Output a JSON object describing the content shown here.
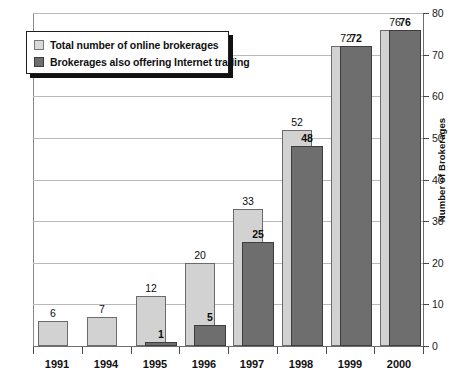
{
  "chart_data": {
    "type": "bar",
    "title": "",
    "subtitle": "",
    "xlabel": "",
    "ylabel": "Number of Brokerages",
    "ylim": [
      0,
      80
    ],
    "ytick_step": 10,
    "yticks": [
      "0",
      "10",
      "20",
      "30",
      "40",
      "50",
      "60",
      "70",
      "80"
    ],
    "grid": true,
    "grid_axis": "y",
    "legend_position": "top-left",
    "categories": [
      "1991",
      "1994",
      "1995",
      "1996",
      "1997",
      "1998",
      "1999",
      "2000"
    ],
    "series": [
      {
        "name": "Total number of online brokerages",
        "color": "#d2d2d2",
        "values": [
          6,
          7,
          12,
          20,
          33,
          52,
          72,
          76
        ],
        "labels": [
          "6",
          "7",
          "12",
          "20",
          "33",
          "52",
          "72",
          "76"
        ]
      },
      {
        "name": "Brokerages also offering Internet trading",
        "color": "#6e6e6e",
        "values": [
          0,
          0,
          1,
          5,
          25,
          48,
          72,
          76
        ],
        "labels": [
          "",
          "",
          "1",
          "5",
          "25",
          "48",
          "72",
          "76"
        ]
      }
    ]
  },
  "legend": {
    "items": [
      {
        "label": "Total number of online brokerages",
        "swatch": "light-swatch-icon"
      },
      {
        "label": "Brokerages also offering Internet trading",
        "swatch": "dark-swatch-icon"
      }
    ]
  },
  "axes": {
    "y_right_title": "Number of Brokerages",
    "y_tick_labels": [
      "80",
      "70",
      "60",
      "50",
      "40",
      "30",
      "20",
      "10",
      "0"
    ],
    "x_tick_labels": [
      "1991",
      "1994",
      "1995",
      "1996",
      "1997",
      "1998",
      "1999",
      "2000"
    ]
  }
}
